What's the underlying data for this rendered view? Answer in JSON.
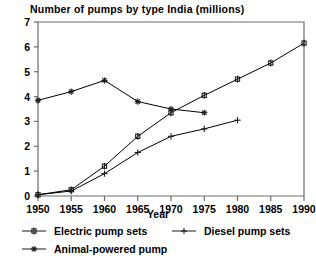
{
  "chart_data": {
    "type": "line",
    "title": "Number of pumps by type India (millions)",
    "xlabel": "Year",
    "ylabel": "",
    "x": [
      1950,
      1955,
      1960,
      1965,
      1970,
      1975,
      1980,
      1985,
      1990
    ],
    "xlim": [
      1950,
      1990
    ],
    "ylim": [
      0,
      7
    ],
    "xticks": [
      1950,
      1955,
      1960,
      1965,
      1970,
      1975,
      1980,
      1985,
      1990
    ],
    "yticks": [
      0,
      1,
      2,
      3,
      4,
      5,
      6,
      7
    ],
    "xticklabels": [
      "1950",
      "1955",
      "1960",
      "1965",
      "1970",
      "1975",
      "1980",
      "1985",
      "1990"
    ],
    "yticklabels": [
      "0",
      "1",
      "2",
      "3",
      "4",
      "5",
      "6",
      "7"
    ],
    "grid": false,
    "legend_position": "below",
    "series": [
      {
        "name": "Electric pump sets",
        "marker": "square-cross",
        "color": "#000000",
        "x": [
          1950,
          1955,
          1960,
          1965,
          1970,
          1975,
          1980,
          1985,
          1990
        ],
        "values": [
          0.05,
          0.25,
          1.2,
          2.4,
          3.35,
          4.05,
          4.7,
          5.35,
          6.15
        ]
      },
      {
        "name": "Diesel pump sets",
        "marker": "plus",
        "color": "#000000",
        "x": [
          1950,
          1955,
          1960,
          1965,
          1970,
          1975,
          1980
        ],
        "values": [
          0.05,
          0.2,
          0.9,
          1.75,
          2.4,
          2.7,
          3.05
        ]
      },
      {
        "name": "Animal-powered pump",
        "marker": "star",
        "color": "#000000",
        "x": [
          1950,
          1955,
          1960,
          1965,
          1970,
          1975
        ],
        "values": [
          3.85,
          4.2,
          4.65,
          3.8,
          3.5,
          3.35
        ]
      }
    ]
  },
  "legend": {
    "entries": [
      {
        "label": "Electric pump sets",
        "marker": "square-cross"
      },
      {
        "label": "Diesel pump sets",
        "marker": "plus"
      },
      {
        "label": "Animal-powered pump",
        "marker": "star"
      }
    ]
  },
  "style": {
    "axis_color": "#6b6b6b",
    "line_color": "#1a1a1a",
    "background": "#ffffff"
  }
}
